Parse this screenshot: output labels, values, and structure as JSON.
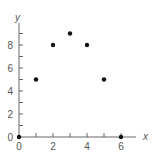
{
  "chart_data": {
    "type": "scatter",
    "title": "",
    "xlabel": "x",
    "ylabel": "y",
    "x": [
      0,
      1,
      2,
      3,
      4,
      5,
      6
    ],
    "y": [
      0,
      5,
      8,
      9,
      8,
      5,
      0
    ],
    "xlim": [
      0,
      7
    ],
    "ylim": [
      0,
      10
    ],
    "xticks": [
      0,
      1,
      2,
      3,
      4,
      5,
      6
    ],
    "xtick_labels": [
      "0",
      "2",
      "4",
      "6"
    ],
    "yticks": [
      0,
      1,
      2,
      3,
      4,
      5,
      6,
      7,
      8,
      9
    ],
    "ytick_labels": [
      "0",
      "2",
      "4",
      "6",
      "8"
    ],
    "grid": false,
    "legend": null,
    "colors": {
      "axis": "#666666",
      "point": "#111111",
      "text": "#555555"
    }
  }
}
